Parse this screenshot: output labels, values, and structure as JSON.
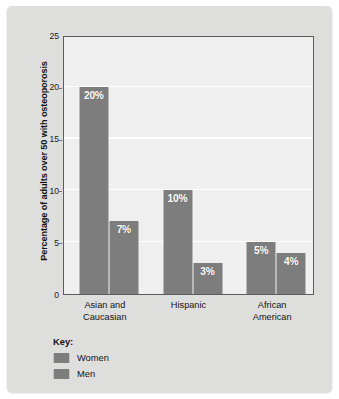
{
  "chart_data": {
    "type": "bar",
    "title": "",
    "xlabel": "",
    "ylabel": "Percentage of adults over 50 with osteoporosis",
    "ylim": [
      0,
      25
    ],
    "yticks": [
      0,
      5,
      10,
      15,
      20,
      25
    ],
    "ytick_labels": [
      "0",
      "5",
      "10",
      "15",
      "20",
      "25"
    ],
    "grid": true,
    "grid_orientation": "horizontal",
    "legend_position": "bottom-left",
    "legend_title": "Key:",
    "categories": [
      "Asian and Caucasian",
      "Hispanic",
      "African American"
    ],
    "category_lines": [
      [
        "Asian and",
        "Caucasian"
      ],
      [
        "Hispanic"
      ],
      [
        "African",
        "American"
      ]
    ],
    "series": [
      {
        "name": "Women",
        "values": [
          20,
          10,
          5
        ],
        "value_labels": [
          "20%",
          "10%",
          "5%"
        ],
        "color": "#7d7d7d"
      },
      {
        "name": "Men",
        "values": [
          7,
          3,
          4
        ],
        "value_labels": [
          "7%",
          "3%",
          "4%"
        ],
        "color": "#7d7d7d"
      }
    ]
  },
  "colors": {
    "card_background": "#dededc",
    "plot_background": "#efefef",
    "plot_border": "#5c5c5c",
    "gridline": "#ffffff",
    "bar_fill": "#7d7d7d",
    "bar_edge_highlight": "#b9b9b9",
    "bar_label_text": "#ffffff",
    "axis_text": "#121212"
  },
  "legend": {
    "title": "Key:",
    "items": [
      {
        "label": "Women",
        "color": "#7d7d7d"
      },
      {
        "label": "Men",
        "color": "#7d7d7d"
      }
    ]
  }
}
